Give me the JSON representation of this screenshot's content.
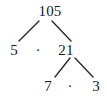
{
  "diagram": {
    "type": "factor-tree",
    "title": "",
    "background_color": "#ffffff",
    "text_color": "#1a1a1a",
    "line_color": "#2b2b2b",
    "nodes": [
      {
        "id": "root",
        "label": "105",
        "x": 50,
        "y": 11
      },
      {
        "id": "left1",
        "label": "5",
        "x": 14,
        "y": 50
      },
      {
        "id": "right1",
        "label": "21",
        "x": 66,
        "y": 50
      },
      {
        "id": "left2",
        "label": "7",
        "x": 48,
        "y": 86
      },
      {
        "id": "right2",
        "label": "3",
        "x": 96,
        "y": 86
      }
    ],
    "operators": [
      {
        "id": "op1",
        "label": "·",
        "x": 38,
        "y": 50
      },
      {
        "id": "op2",
        "label": "·",
        "x": 70,
        "y": 86
      }
    ],
    "edges": [
      {
        "id": "edge-root-left",
        "from": "root",
        "to": "left1",
        "x1": 39,
        "y1": 21,
        "x2": 19,
        "y2": 41
      },
      {
        "id": "edge-root-right",
        "from": "root",
        "to": "right1",
        "x1": 52,
        "y1": 21,
        "x2": 71,
        "y2": 41
      },
      {
        "id": "edge-21-left",
        "from": "right1",
        "to": "left2",
        "x1": 70,
        "y1": 58,
        "x2": 55,
        "y2": 77
      },
      {
        "id": "edge-21-right",
        "from": "right1",
        "to": "right2",
        "x1": 75,
        "y1": 58,
        "x2": 93,
        "y2": 77
      }
    ]
  }
}
